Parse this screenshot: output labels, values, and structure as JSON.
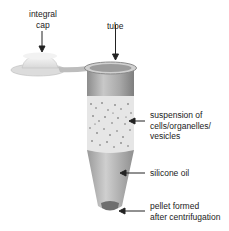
{
  "diagram": {
    "labels": {
      "cap_line1": "integral",
      "cap_line2": "cap",
      "tube": "tube",
      "suspension_line1": "suspension of",
      "suspension_line2": "cells/organelles/",
      "suspension_line3": "vesicles",
      "oil": "silicone oil",
      "pellet_line1": "pellet formed",
      "pellet_line2": "after centrifugation"
    },
    "colors": {
      "tube_wall": "#9a9a9a",
      "suspension": "#e4e4e4",
      "oil": "#b8b8b8",
      "pellet": "#707070",
      "text": "#222222"
    }
  }
}
